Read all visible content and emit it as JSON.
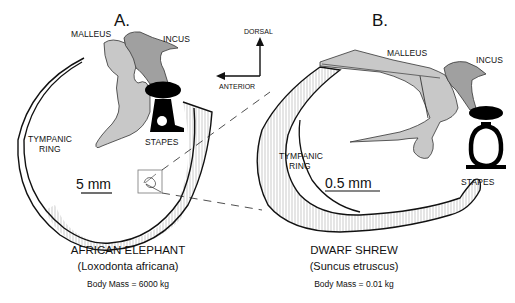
{
  "panels": {
    "A": {
      "letter": "A.",
      "labels": {
        "malleus": "MALLEUS",
        "incus": "INCUS",
        "stapes": "STAPES",
        "tympanic_ring_line1": "TYMPANIC",
        "tympanic_ring_line2": "RING"
      },
      "scale_bar": "5 mm",
      "species": "AFRICAN ELEPHANT",
      "scientific_name": "(Loxodonta africana)",
      "body_mass": "Body Mass = 6000 kg"
    },
    "B": {
      "letter": "B.",
      "labels": {
        "malleus": "MALLEUS",
        "incus": "INCUS",
        "stapes": "STAPES",
        "tympanic_ring_line1": "TYMPANIC",
        "tympanic_ring_line2": "RING"
      },
      "scale_bar": "0.5 mm",
      "species": "DWARF SHREW",
      "scientific_name": "(Suncus etruscus)",
      "body_mass": "Body Mass =  0.01 kg"
    }
  },
  "orientation": {
    "dorsal": "DORSAL",
    "anterior": "ANTERIOR"
  },
  "colors": {
    "malleus_fill": "#c8c8c8",
    "incus_fill": "#a0a0a0",
    "stapes_fill": "#000000",
    "line": "#111111"
  }
}
